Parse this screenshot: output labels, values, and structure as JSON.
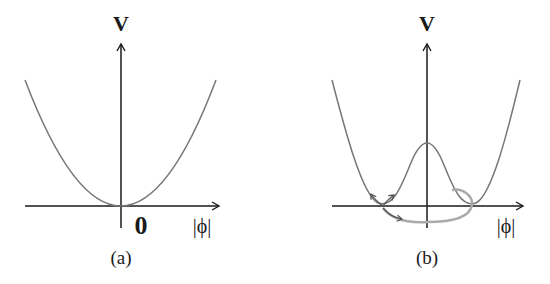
{
  "panels": [
    {
      "id": "a",
      "y_axis_label": "V",
      "x_axis_label": "|ϕ|",
      "origin_label": "0",
      "caption": "(a)",
      "curve": "single-well parabola, minimum at origin"
    },
    {
      "id": "b",
      "y_axis_label": "V",
      "x_axis_label": "|ϕ|",
      "caption": "(b)",
      "curve": "double-well (Mexican hat) potential with central peak",
      "trajectory": "gray loop around the minimum ring with arrows"
    }
  ],
  "colors": {
    "axis": "#1a1a1a",
    "curve": "#777777",
    "trajectory": "#aaaaaa",
    "arrow": "#555555"
  }
}
